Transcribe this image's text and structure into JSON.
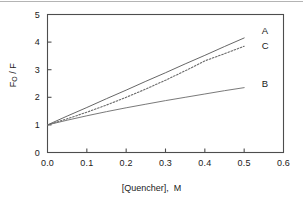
{
  "chart_data": {
    "type": "line",
    "title": "",
    "subtitle": "",
    "xlabel": "[Quencher],  M",
    "ylabel": "F_O / F",
    "ylabel_main": "F",
    "ylabel_sub": "O",
    "ylabel_tail": " / F",
    "xlim": [
      0.0,
      0.6
    ],
    "ylim": [
      0,
      5
    ],
    "grid": false,
    "legend": "inline-right-end-labels",
    "xticks": [
      0.0,
      0.1,
      0.2,
      0.3,
      0.4,
      0.5,
      0.6
    ],
    "xtick_labels": [
      "0.0",
      "0.1",
      "0.2",
      "0.3",
      "0.4",
      "0.5",
      "0.6"
    ],
    "yticks": [
      0,
      1,
      2,
      3,
      4,
      5
    ],
    "ytick_labels": [
      "0",
      "1",
      "2",
      "3",
      "4",
      "5"
    ],
    "series": [
      {
        "name": "A",
        "label": "A",
        "style": "solid",
        "color": "#555555",
        "annotation_y": 4.45,
        "x": [
          0.0,
          0.05,
          0.1,
          0.15,
          0.2,
          0.25,
          0.3,
          0.35,
          0.4,
          0.45,
          0.5
        ],
        "values": [
          1.0,
          1.32,
          1.63,
          1.95,
          2.26,
          2.58,
          2.89,
          3.21,
          3.52,
          3.84,
          4.15
        ]
      },
      {
        "name": "C",
        "label": "C",
        "style": "dotted",
        "color": "#6a6a6a",
        "annotation_y": 3.88,
        "x": [
          0.0,
          0.05,
          0.1,
          0.15,
          0.2,
          0.25,
          0.3,
          0.35,
          0.4,
          0.45,
          0.5
        ],
        "values": [
          1.0,
          1.22,
          1.46,
          1.72,
          2.0,
          2.3,
          2.62,
          2.96,
          3.32,
          3.58,
          3.85
        ]
      },
      {
        "name": "B",
        "label": "B",
        "style": "solid",
        "color": "#6a6a6a",
        "annotation_y": 2.52,
        "x": [
          0.0,
          0.05,
          0.1,
          0.15,
          0.2,
          0.25,
          0.3,
          0.35,
          0.4,
          0.45,
          0.5
        ],
        "values": [
          1.0,
          1.17,
          1.33,
          1.48,
          1.62,
          1.75,
          1.88,
          2.0,
          2.12,
          2.24,
          2.35
        ]
      }
    ],
    "annotations": [
      {
        "text": "A",
        "x": 0.545,
        "y": 4.45
      },
      {
        "text": "C",
        "x": 0.545,
        "y": 3.88
      },
      {
        "text": "B",
        "x": 0.545,
        "y": 2.52
      }
    ]
  }
}
